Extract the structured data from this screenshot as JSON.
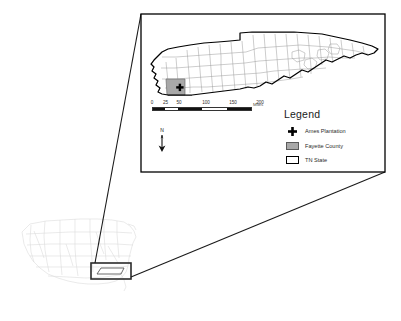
{
  "figure": {
    "type": "locator-map"
  },
  "main_map": {
    "subject": "Tennessee state with county boundaries",
    "highlight_county": "Fayette County",
    "point_marker": "Ames Plantation"
  },
  "legend": {
    "title": "Legend",
    "items": [
      {
        "symbol": "plus-marker",
        "label": "Ames Plantation"
      },
      {
        "symbol": "gray-fill-swatch",
        "label": "Fayette County"
      },
      {
        "symbol": "white-outline-swatch",
        "label": "TN State"
      }
    ]
  },
  "scale_bar": {
    "labels": [
      "0",
      "25",
      "50",
      "100",
      "150",
      "200"
    ],
    "positions_pct": [
      0,
      12.5,
      25,
      50,
      75,
      100
    ],
    "unit": "Miles"
  },
  "north_arrow": {
    "label": "N"
  },
  "inset_map": {
    "subject": "Contiguous United States",
    "highlight_box_label": "Tennessee"
  },
  "colors": {
    "county_fill": "#a8a8a8",
    "state_outline": "#000000",
    "county_line": "#8a8a8a",
    "inset_line": "#d4d4d4",
    "frame": "#000000",
    "leader_line": "#1a1a1a",
    "background": "#ffffff"
  }
}
